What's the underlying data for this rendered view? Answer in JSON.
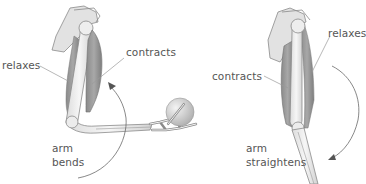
{
  "diagram": {
    "panels": [
      {
        "id": "arm-bending",
        "labels": {
          "relaxes": "relaxes",
          "contracts": "contracts",
          "motion_line1": "arm",
          "motion_line2": "bends"
        }
      },
      {
        "id": "arm-straightening",
        "labels": {
          "relaxes": "relaxes",
          "contracts": "contracts",
          "motion_line1": "arm",
          "motion_line2": "straightens"
        }
      }
    ],
    "colors": {
      "muscle": "#9a9a9a",
      "muscle_dark": "#7d7d7d",
      "bone": "#ececec",
      "bone_outline": "#8a8a8a",
      "leader_line": "#9a9a9a",
      "arrow": "#6a6a6a",
      "text": "#555555",
      "ball": "#d8d8d8"
    }
  }
}
